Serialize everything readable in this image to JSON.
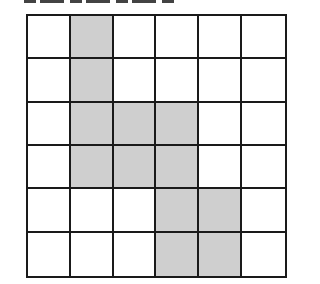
{
  "diagram": {
    "rows": 6,
    "cols": 6,
    "colors": {
      "shaded": "#cfcfcf",
      "empty": "#ffffff",
      "line": "#1a1a1a"
    },
    "shaded_cells": [
      [
        0,
        1
      ],
      [
        1,
        1
      ],
      [
        2,
        1
      ],
      [
        2,
        2
      ],
      [
        2,
        3
      ],
      [
        3,
        1
      ],
      [
        3,
        2
      ],
      [
        3,
        3
      ],
      [
        4,
        3
      ],
      [
        4,
        4
      ],
      [
        5,
        3
      ],
      [
        5,
        4
      ]
    ]
  }
}
